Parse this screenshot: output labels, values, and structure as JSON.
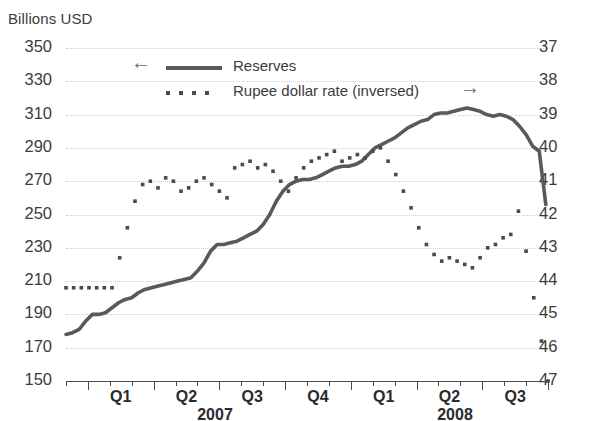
{
  "chart_data": {
    "type": "line",
    "title": "",
    "ylabel": "Billions USD",
    "y2label": "",
    "xlabel": "",
    "ylim": [
      150,
      350
    ],
    "y2lim": [
      47,
      37
    ],
    "y2_inverted": true,
    "grid": true,
    "legend_position": "inside-top-center",
    "y_ticks": [
      350,
      330,
      310,
      290,
      270,
      250,
      230,
      210,
      190,
      170,
      150
    ],
    "y2_ticks": [
      37,
      38,
      39,
      40,
      41,
      42,
      43,
      44,
      45,
      46,
      47
    ],
    "quarter_labels": [
      "Q1",
      "Q2",
      "Q3",
      "Q4",
      "Q1",
      "Q2",
      "Q3"
    ],
    "year_labels": [
      "2007",
      "2008"
    ],
    "x_months": [
      "2006-12",
      "2007-01",
      "2007-02",
      "2007-03",
      "2007-04",
      "2007-05",
      "2007-06",
      "2007-07",
      "2007-08",
      "2007-09",
      "2007-10",
      "2007-11",
      "2007-12",
      "2008-01",
      "2008-02",
      "2008-03",
      "2008-04",
      "2008-05",
      "2008-06",
      "2008-07",
      "2008-08",
      "2008-09",
      "2008-10"
    ],
    "legend": [
      {
        "name": "Reserves",
        "style": "solid-line",
        "axis": "left",
        "arrow": "left-arrow",
        "color": "#595959"
      },
      {
        "name": "Rupee dollar rate (inversed)",
        "style": "dotted-markers",
        "axis": "right",
        "arrow": "right-arrow",
        "color": "#4a4a4a"
      }
    ],
    "series": [
      {
        "name": "Reserves",
        "axis": "left",
        "unit": "Billions USD",
        "x": [
          0,
          0.3,
          0.6,
          0.9,
          1.2,
          1.5,
          1.8,
          2.1,
          2.4,
          2.7,
          3.0,
          3.3,
          3.6,
          3.9,
          4.2,
          4.5,
          4.8,
          5.1,
          5.4,
          5.7,
          6.0,
          6.3,
          6.6,
          6.9,
          7.2,
          7.5,
          7.8,
          8.1,
          8.4,
          8.7,
          9.0,
          9.3,
          9.6,
          9.9,
          10.2,
          10.5,
          10.8,
          11.1,
          11.4,
          11.7,
          12.0,
          12.3,
          12.6,
          12.9,
          13.2,
          13.5,
          13.8,
          14.1,
          14.4,
          14.7,
          15.0,
          15.3,
          15.6,
          15.9,
          16.2,
          16.5,
          16.8,
          17.1,
          17.4,
          17.7,
          18.0,
          18.3,
          18.6,
          18.9,
          19.2,
          19.5,
          19.8,
          20.1,
          20.4,
          20.7,
          21.0,
          21.3,
          21.6,
          21.9
        ],
        "values": [
          178,
          179,
          181,
          186,
          190,
          190,
          191,
          194,
          197,
          199,
          200,
          203,
          205,
          206,
          207,
          208,
          209,
          210,
          211,
          212,
          216,
          221,
          228,
          232,
          232,
          233,
          234,
          236,
          238,
          240,
          244,
          250,
          258,
          264,
          268,
          270,
          271,
          271,
          272,
          274,
          276,
          278,
          279,
          279,
          280,
          282,
          286,
          290,
          292,
          294,
          296,
          299,
          302,
          304,
          306,
          307,
          310,
          311,
          311,
          312,
          313,
          314,
          313,
          312,
          310,
          309,
          310,
          309,
          307,
          303,
          298,
          291,
          288,
          256
        ]
      },
      {
        "name": "Rupee dollar rate (inversed)",
        "axis": "right",
        "unit": "INR per USD",
        "x": [
          0,
          0.35,
          0.7,
          1.05,
          1.4,
          1.75,
          2.1,
          2.45,
          2.8,
          3.15,
          3.5,
          3.85,
          4.2,
          4.55,
          4.9,
          5.25,
          5.6,
          5.95,
          6.3,
          6.65,
          7.0,
          7.35,
          7.7,
          8.05,
          8.4,
          8.75,
          9.1,
          9.45,
          9.8,
          10.15,
          10.5,
          10.85,
          11.2,
          11.55,
          11.9,
          12.25,
          12.6,
          12.95,
          13.3,
          13.65,
          14.0,
          14.35,
          14.7,
          15.05,
          15.4,
          15.75,
          16.1,
          16.45,
          16.8,
          17.15,
          17.5,
          17.85,
          18.2,
          18.55,
          18.9,
          19.25,
          19.6,
          19.95,
          20.3,
          20.65,
          21.0,
          21.35,
          21.7,
          22.0
        ],
        "values": [
          44.2,
          44.2,
          44.2,
          44.2,
          44.2,
          44.2,
          44.2,
          43.3,
          42.4,
          41.6,
          41.1,
          41.0,
          41.2,
          40.9,
          41.0,
          41.3,
          41.2,
          41.0,
          40.9,
          41.1,
          41.3,
          41.5,
          40.6,
          40.5,
          40.4,
          40.6,
          40.5,
          40.7,
          41.0,
          41.3,
          40.9,
          40.6,
          40.4,
          40.3,
          40.2,
          40.1,
          40.4,
          40.3,
          40.2,
          40.3,
          40.1,
          40.0,
          40.4,
          40.8,
          41.3,
          41.8,
          42.4,
          42.9,
          43.2,
          43.4,
          43.3,
          43.4,
          43.5,
          43.6,
          43.3,
          43.0,
          42.9,
          42.7,
          42.6,
          41.9,
          43.1,
          44.5,
          45.8,
          47.0
        ]
      }
    ]
  }
}
